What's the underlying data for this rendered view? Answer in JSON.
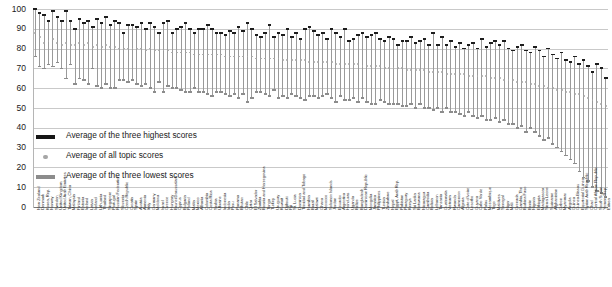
{
  "chart_data": {
    "type": "line",
    "title": "",
    "subtitle": "",
    "xlabel": "",
    "ylabel": "",
    "ylim": [
      0,
      100
    ],
    "grid": true,
    "legend_position": "inside-left",
    "yticks": [
      0,
      10,
      20,
      30,
      40,
      50,
      60,
      70,
      80,
      90,
      100
    ],
    "legend": [
      {
        "label": "Average of the three highest scores",
        "marker": "dark-bar",
        "color": "#161616"
      },
      {
        "label": "Average of all topic scores",
        "marker": "gray-dot",
        "color": "#a6a6a6"
      },
      {
        "label": "Average of the three lowest scores",
        "marker": "gray-bar",
        "color": "#8c8c8c"
      }
    ],
    "series": [
      {
        "name": "Average of the three highest scores",
        "key": "high"
      },
      {
        "name": "Average of all topic scores",
        "key": "avg"
      },
      {
        "name": "Average of the three lowest scores",
        "key": "low"
      }
    ],
    "categories": [
      "New Zealand",
      "Denmark",
      "Korea, Rep.",
      "Norway",
      "Sweden",
      "United Kingdom",
      "United Arab Emirates",
      "Taiwan, China",
      "Malaysia",
      "Finland",
      "Estonia",
      "Ireland",
      "Latvia",
      "Iceland",
      "Lithuania",
      "Thailand",
      "Singapore",
      "Portugal",
      "Russian Federation",
      "Slovenia",
      "Czech Republic",
      "Croatia",
      "Spain",
      "Austria",
      "Armenia",
      "Italy",
      "Germany",
      "Moldova",
      "Israel",
      "Greece",
      "Hungary",
      "Brunei Darussalam",
      "Cyprus",
      "Bulgaria",
      "Poland",
      "Malta",
      "Mexico",
      "Albania",
      "Colombia",
      "Costa Rica",
      "Serbia",
      "Ukraine",
      "Indonesia",
      "India",
      "Peru",
      "Panama",
      "Bhutan",
      "Chile",
      "Qatar",
      "El Salvador",
      "Zambia",
      "Bosnia and Herzegovina",
      "Tonga",
      "Turkey",
      "Uruguay",
      "Kuwait",
      "Djibouti",
      "Fiji",
      "St. Lucia",
      "Dominica",
      "Trinidad and Tobago",
      "Namibia",
      "Brazil",
      "Malawi",
      "Ghana",
      "Morocco",
      "Solomon Islands",
      "Jordan",
      "Ecuador",
      "Argentina",
      "Honduras",
      "Uganda",
      "Belize",
      "Bangladesh",
      "Dominican Republic",
      "Mongolia",
      "Jamaica",
      "Philippines",
      "Tunisia",
      "Zimbabwe",
      "Nepal",
      "Egypt, Arab Rep.",
      "Pakistan",
      "Paraguay",
      "Kenya",
      "Sri Lanka",
      "Botswana",
      "Nicaragua",
      "Cambodia",
      "Bolivia",
      "Lebanon",
      "Tanzania",
      "Guatemala",
      "Vietnam",
      "Rwanda",
      "Cameroon",
      "Algeria",
      "Cote d'Ivoire",
      "Lesotho",
      "Guyana",
      "Cabo Verde",
      "Palau",
      "Mozambique",
      "Togo",
      "Maldives",
      "Senegal",
      "Niger",
      "Mali",
      "Grenada",
      "Gambia, The",
      "Burkina Faso",
      "Benin",
      "Nigeria",
      "Ethiopia",
      "Madagascar",
      "Sierra Leone",
      "Suriname",
      "Afghanistan",
      "Gabon",
      "Myanmar",
      "Angola",
      "Guinea",
      "Guinea-Bissau",
      "Equatorial Guinea",
      "Syrian Arab Republic",
      "Chad",
      "Central African Republic",
      "South Sudan",
      "Yemen, Rep.",
      "Eritrea"
    ],
    "high": [
      100,
      98,
      97,
      94,
      99,
      96,
      94,
      99,
      94,
      90,
      95,
      93,
      94,
      91,
      95,
      93,
      96,
      92,
      94,
      93,
      88,
      92,
      92,
      91,
      93,
      90,
      93,
      91,
      88,
      93,
      94,
      88,
      90,
      91,
      93,
      90,
      88,
      90,
      90,
      92,
      90,
      88,
      88,
      87,
      89,
      88,
      91,
      89,
      93,
      90,
      87,
      86,
      88,
      92,
      86,
      88,
      87,
      90,
      86,
      88,
      85,
      90,
      91,
      89,
      87,
      88,
      85,
      90,
      88,
      86,
      90,
      84,
      85,
      87,
      88,
      86,
      87,
      88,
      85,
      84,
      86,
      85,
      82,
      84,
      84,
      86,
      83,
      84,
      85,
      82,
      88,
      82,
      86,
      82,
      84,
      81,
      83,
      80,
      82,
      83,
      80,
      85,
      81,
      83,
      84,
      82,
      84,
      80,
      79,
      81,
      82,
      79,
      78,
      81,
      79,
      76,
      80,
      77,
      75,
      78,
      74,
      73,
      76,
      72,
      74,
      71,
      68,
      72,
      70,
      65,
      63,
      61,
      58,
      54,
      52
    ],
    "avg": [
      88,
      86,
      83,
      84,
      85,
      83,
      82,
      83,
      82,
      82,
      83,
      82,
      83,
      81,
      82,
      81,
      82,
      81,
      81,
      80,
      80,
      80,
      80,
      80,
      80,
      79,
      80,
      79,
      79,
      79,
      79,
      78,
      78,
      78,
      78,
      78,
      77,
      77,
      77,
      77,
      77,
      77,
      77,
      76,
      76,
      76,
      76,
      76,
      76,
      76,
      75,
      75,
      75,
      75,
      75,
      75,
      74,
      74,
      74,
      74,
      74,
      74,
      73,
      73,
      73,
      73,
      73,
      73,
      72,
      72,
      72,
      72,
      72,
      72,
      71,
      71,
      71,
      71,
      71,
      70,
      70,
      70,
      70,
      70,
      69,
      69,
      69,
      69,
      69,
      68,
      68,
      68,
      68,
      67,
      67,
      67,
      67,
      67,
      66,
      66,
      66,
      66,
      66,
      65,
      65,
      65,
      64,
      64,
      64,
      63,
      63,
      63,
      62,
      62,
      61,
      61,
      60,
      60,
      59,
      59,
      58,
      58,
      57,
      57,
      56,
      55,
      54,
      53,
      52,
      51,
      50,
      49,
      48,
      46,
      44
    ],
    "low": [
      76,
      71,
      70,
      72,
      71,
      73,
      70,
      65,
      72,
      62,
      65,
      64,
      62,
      70,
      61,
      60,
      62,
      60,
      60,
      64,
      64,
      63,
      64,
      62,
      61,
      62,
      60,
      58,
      63,
      58,
      61,
      60,
      60,
      59,
      58,
      58,
      60,
      58,
      58,
      57,
      56,
      58,
      58,
      57,
      56,
      57,
      55,
      57,
      53,
      55,
      58,
      58,
      57,
      56,
      59,
      55,
      56,
      55,
      57,
      56,
      55,
      54,
      56,
      56,
      55,
      56,
      57,
      55,
      53,
      56,
      54,
      54,
      55,
      53,
      55,
      53,
      52,
      52,
      54,
      53,
      52,
      52,
      52,
      51,
      51,
      52,
      50,
      52,
      50,
      50,
      49,
      50,
      48,
      50,
      48,
      48,
      47,
      46,
      48,
      46,
      45,
      46,
      44,
      44,
      45,
      43,
      44,
      42,
      42,
      40,
      41,
      38,
      40,
      38,
      36,
      34,
      35,
      32,
      30,
      28,
      26,
      24,
      22,
      18,
      15,
      13,
      10,
      8,
      7,
      5,
      4,
      3,
      2,
      2,
      1
    ]
  }
}
